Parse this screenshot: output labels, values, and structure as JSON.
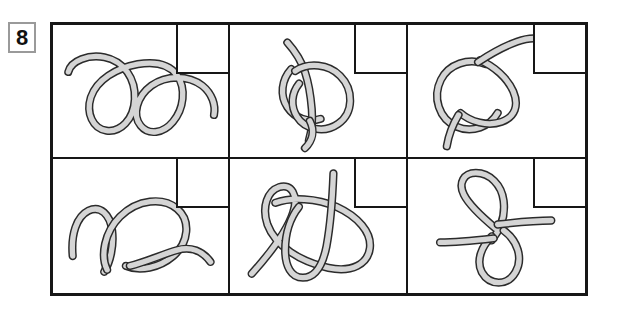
{
  "item": {
    "number": "8",
    "label": "knot-identification-item"
  },
  "grid": {
    "rows": 2,
    "columns": 3,
    "cells": [
      {
        "position": "top-left",
        "figure_name": "double-loop-rope",
        "description": "Rope forming two side-by-side open loops, like a cursive double-e, open ends at left and right",
        "answer_box": true,
        "answer_value": ""
      },
      {
        "position": "top-middle",
        "figure_name": "overhand-loop-knot",
        "description": "Rope with a large round loop and a small crossing twist, tail rising up-left and tail hanging down",
        "answer_box": true,
        "answer_value": ""
      },
      {
        "position": "top-right",
        "figure_name": "slip-knot-rope",
        "description": "Rope with a circular loop crossed by a strand, tail curving up to the right and tail hanging down-left",
        "answer_box": true,
        "answer_value": ""
      },
      {
        "position": "bottom-left",
        "figure_name": "wave-loop-rope",
        "description": "Rope with a small hump at left and a large oval loop at right, long tail sweeping to the lower right",
        "answer_box": true,
        "answer_value": ""
      },
      {
        "position": "bottom-middle",
        "figure_name": "crossed-double-loop-knot",
        "description": "Two elongated loops crossing at a shallow angle with a straight strand passing vertically through them",
        "answer_box": true,
        "answer_value": ""
      },
      {
        "position": "bottom-right",
        "figure_name": "figure-eight-rope",
        "description": "Figure-eight shape with an upper teardrop loop and lower round loop, two straight tails extending right and left",
        "answer_box": true,
        "answer_value": ""
      }
    ]
  },
  "colors": {
    "frame": "#171717",
    "divider": "#171717",
    "rope_outline": "#2b2b2b",
    "rope_core": "#d5d5d5",
    "badge_border": "#9a9a9a",
    "background": "#ffffff"
  }
}
